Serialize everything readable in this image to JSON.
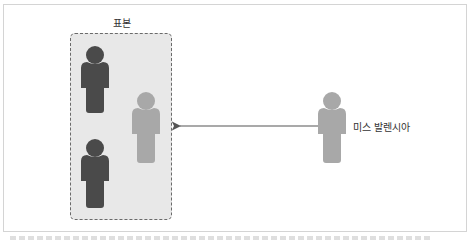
{
  "diagram": {
    "sample_title": "표본",
    "outside_label": "미스 발렌시아",
    "colors": {
      "dark_person": "#4a4a4a",
      "light_person": "#a8a8a8",
      "sample_fill": "#e8e8e8",
      "sample_border": "#6a6a6a",
      "arrow": "#555555"
    },
    "people": [
      {
        "id": "sample-person-1",
        "shade": "dark",
        "in_sample": true
      },
      {
        "id": "sample-person-2",
        "shade": "light",
        "in_sample": true
      },
      {
        "id": "sample-person-3",
        "shade": "dark",
        "in_sample": true
      },
      {
        "id": "miss-valencia",
        "shade": "light",
        "in_sample": false
      }
    ],
    "arrow": {
      "from": "miss-valencia",
      "to": "sample-box"
    }
  }
}
